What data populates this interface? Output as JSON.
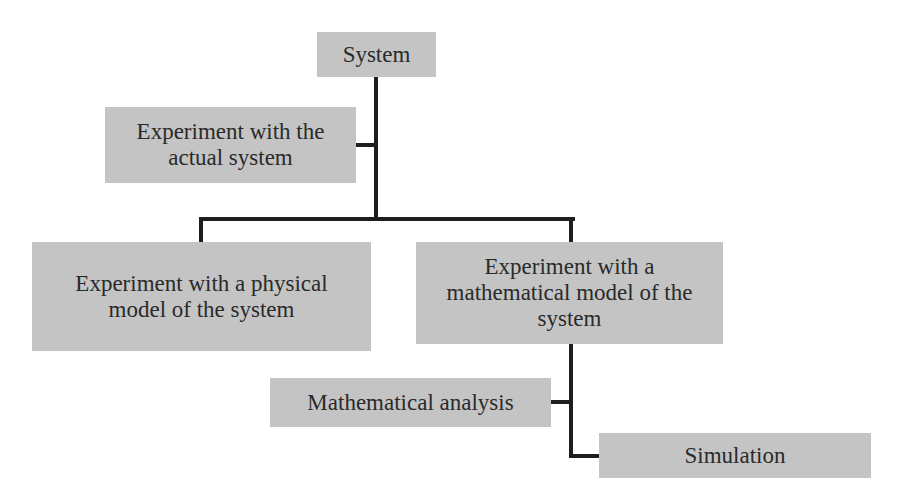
{
  "diagram": {
    "type": "tree",
    "colors": {
      "box_fill": "#c4c4c4",
      "line": "#1e1e1e",
      "text": "#2a2a2a",
      "background": "#ffffff"
    },
    "nodes": {
      "system": {
        "label": "System"
      },
      "actual": {
        "label_lines": [
          "Experiment with the",
          "actual system"
        ]
      },
      "physical": {
        "label_lines": [
          "Experiment with a physical",
          "model of the system"
        ]
      },
      "mathematical": {
        "label_lines": [
          "Experiment with a",
          "mathematical model of the",
          "system"
        ]
      },
      "analysis": {
        "label": "Mathematical analysis"
      },
      "simulation": {
        "label": "Simulation"
      }
    },
    "edges": [
      {
        "from": "System",
        "to": "Experiment with the actual system"
      },
      {
        "from": "System",
        "to": "Experiment with a physical model of the system"
      },
      {
        "from": "System",
        "to": "Experiment with a mathematical model of the system"
      },
      {
        "from": "Experiment with a mathematical model of the system",
        "to": "Mathematical analysis"
      },
      {
        "from": "Experiment with a mathematical model of the system",
        "to": "Simulation"
      }
    ]
  }
}
